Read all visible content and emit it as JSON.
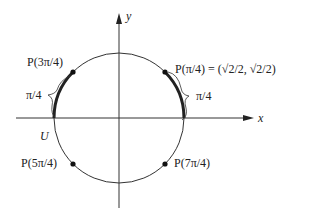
{
  "diagram": {
    "axes": {
      "x_label": "x",
      "y_label": "y"
    },
    "circle_label": "U",
    "points": [
      {
        "id": "p1",
        "label": "P(π/4) = (√2/2, √2/2)",
        "angle": "π/4"
      },
      {
        "id": "p3",
        "label": "P(3π/4)",
        "angle": "3π/4"
      },
      {
        "id": "p5",
        "label": "P(5π/4)",
        "angle": "5π/4"
      },
      {
        "id": "p7",
        "label": "P(7π/4)",
        "angle": "7π/4"
      }
    ],
    "arc_labels": {
      "right": "π/4",
      "left": "π/4"
    }
  }
}
